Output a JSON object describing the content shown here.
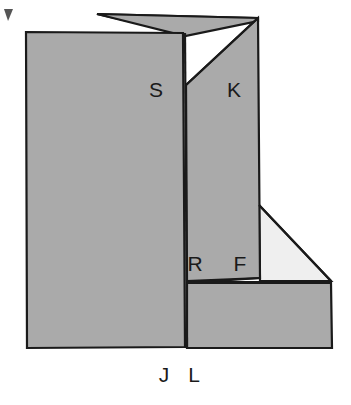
{
  "figure": {
    "type": "technical-line-drawing",
    "canvas": {
      "width": 351,
      "height": 405
    },
    "colors": {
      "background": "#ffffff",
      "face_fill": "#aaaaaa",
      "highlight_fill": "#efefef",
      "outline": "#1a1a1a",
      "label_color": "#1a1a1a"
    },
    "stroke_width": 2.2,
    "labels": {
      "face_S": {
        "text": "S",
        "x": 156,
        "y": 91
      },
      "face_K": {
        "text": "K",
        "x": 234,
        "y": 91
      },
      "edge_R": {
        "text": "R",
        "x": 195,
        "y": 265
      },
      "edge_F": {
        "text": "F",
        "x": 240,
        "y": 265
      },
      "edge_J": {
        "text": "J",
        "x": 164,
        "y": 376
      },
      "edge_L": {
        "text": "L",
        "x": 194,
        "y": 376
      }
    },
    "polygons": {
      "top_back_sliver": {
        "name": "top-back-sliver-face",
        "fill": "#efefef",
        "points": "97,14 258,18 185,34"
      },
      "top_right_band": {
        "name": "top-right-band-face",
        "fill": "#aaaaaa",
        "points": "97,14 258,18 258,21 185,36"
      },
      "left_face_S": {
        "name": "left-face-s",
        "fill": "#aaaaaa",
        "points": "26,32 183,33 185,347 27,348"
      },
      "right_face_K": {
        "name": "right-face-k",
        "fill": "#aaaaaa",
        "points": "186,85 258,18 260,278 187,281"
      },
      "right_light_triangle": {
        "name": "right-bevel-triangle",
        "fill": "#efefef",
        "points": "259,205 331,281 260,281"
      },
      "base_front": {
        "name": "base-front-face",
        "fill": "#aaaaaa",
        "points": "187,283 331,283 332,348 187,348"
      }
    },
    "lines": {
      "diagonal_top": {
        "name": "diagonal-top-edge",
        "x1": 186,
        "y1": 85,
        "x2": 258,
        "y2": 18
      },
      "vertical_spine": {
        "name": "vertical-spine-edge",
        "x1": 185,
        "y1": 33,
        "x2": 187,
        "y2": 348
      },
      "horizontal_step": {
        "name": "horizontal-step-edge",
        "x1": 187,
        "y1": 282,
        "x2": 331,
        "y2": 282
      },
      "slant_rf": {
        "name": "slant-rf-edge",
        "x1": 187,
        "y1": 283,
        "x2": 260,
        "y2": 278
      },
      "bevel_diagonal": {
        "name": "bevel-diagonal-edge",
        "x1": 259,
        "y1": 205,
        "x2": 331,
        "y2": 281
      }
    },
    "corner_mark": {
      "name": "corner-artifact-mark",
      "x": 4,
      "y": 9,
      "width": 9,
      "height": 12
    }
  }
}
